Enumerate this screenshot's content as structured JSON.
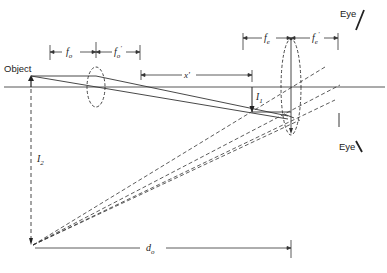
{
  "diagram": {
    "type": "compound microscope ray diagram",
    "labels": {
      "object": "Object",
      "eye_top": "Eye",
      "eye_bottom": "Eye",
      "f_o": "f",
      "f_o_sub": "o",
      "f_o_prime": "f",
      "f_o_prime_sub": "o",
      "f_o_prime_mark": "'",
      "x_prime": "x'",
      "f_e": "f",
      "f_e_sub": "e",
      "f_e_prime": "f",
      "f_e_prime_sub": "e",
      "f_e_prime_mark": "'",
      "I1": "I",
      "I1_sub": "1",
      "I2": "I",
      "I2_sub": "2",
      "d_o": "d",
      "d_o_sub": "o"
    },
    "elements": [
      "optical-axis",
      "object-arrow",
      "objective-lens",
      "eyepiece-lens",
      "intermediate-image-I1",
      "virtual-image-I2",
      "eye-position-marks",
      "dimension-lines"
    ],
    "colors": {
      "line": "#333333",
      "background": "#ffffff"
    }
  }
}
